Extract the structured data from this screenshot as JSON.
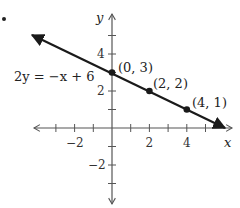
{
  "graph": {
    "equation": "2y = −x + 6",
    "x_axis_label": "x",
    "y_axis_label": "y",
    "x_tick_labels": [
      {
        "value": -2,
        "text": "−2"
      },
      {
        "value": 2,
        "text": "2"
      },
      {
        "value": 4,
        "text": "4"
      }
    ],
    "y_tick_labels": [
      {
        "value": 4,
        "text": "4"
      },
      {
        "value": 2,
        "text": "2"
      },
      {
        "value": -2,
        "text": "−2"
      }
    ],
    "points": [
      {
        "x": 0,
        "y": 3,
        "label": "(0, 3)"
      },
      {
        "x": 2,
        "y": 2,
        "label": "(2, 2)"
      },
      {
        "x": 4,
        "y": 1,
        "label": "(4, 1)"
      }
    ],
    "x_range": [
      -4,
      6
    ],
    "y_range": [
      -4,
      6
    ],
    "line_color": "#1a1a1a",
    "axis_color": "#555555"
  }
}
